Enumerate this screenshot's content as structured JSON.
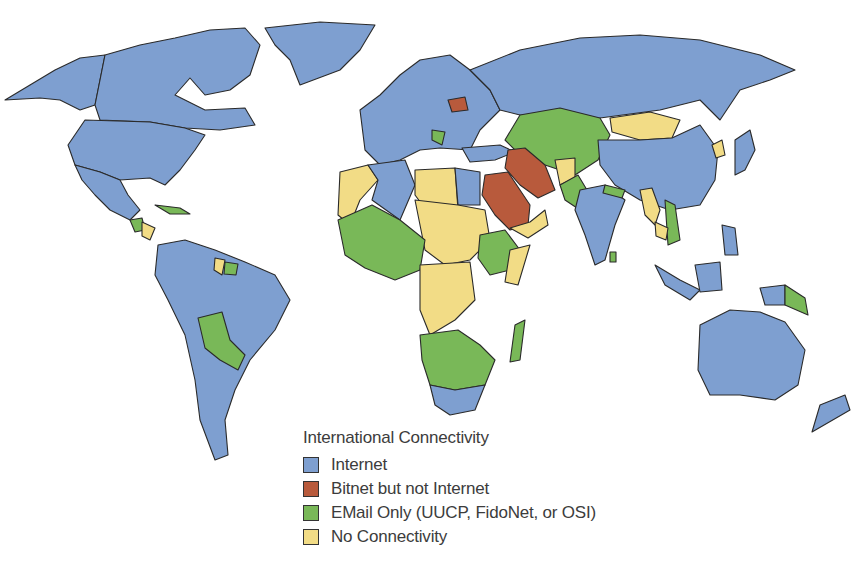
{
  "map": {
    "title": "International Connectivity",
    "type": "choropleth world map",
    "categories": [
      {
        "key": "internet",
        "label": "Internet",
        "color": "#7e9fd0"
      },
      {
        "key": "bitnet",
        "label": "Bitnet but not Internet",
        "color": "#b85a3c"
      },
      {
        "key": "email",
        "label": "EMail Only (UUCP, FidoNet, or OSI)",
        "color": "#79b858"
      },
      {
        "key": "none",
        "label": "No Connectivity",
        "color": "#f2dc86"
      }
    ]
  },
  "legend": {
    "title": "International Connectivity",
    "items": [
      {
        "label": "Internet",
        "color": "#7e9fd0"
      },
      {
        "label": "Bitnet but not Internet",
        "color": "#b85a3c"
      },
      {
        "label": "EMail Only (UUCP, FidoNet, or OSI)",
        "color": "#79b858"
      },
      {
        "label": "No Connectivity",
        "color": "#f2dc86"
      }
    ]
  }
}
